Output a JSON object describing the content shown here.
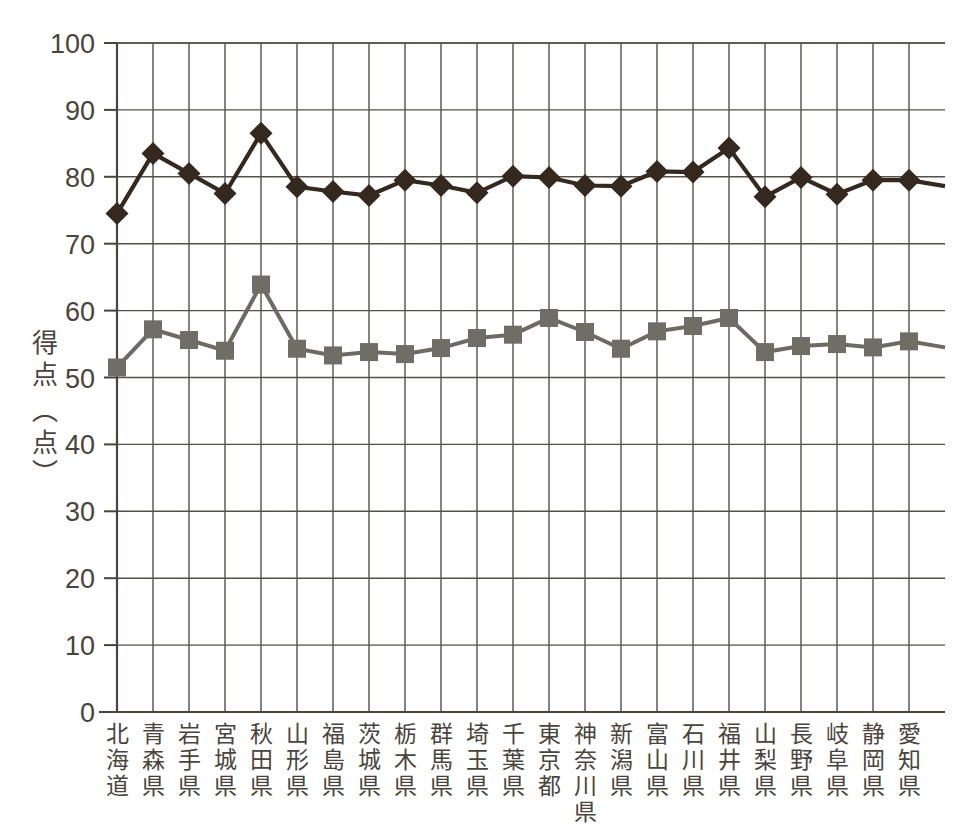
{
  "chart_data": {
    "type": "line",
    "title": "",
    "xlabel": "",
    "ylabel": "得点(点)",
    "ylabel_chars": [
      "得",
      "点",
      "(点)"
    ],
    "ylim": [
      0,
      100
    ],
    "ytick_step": 10,
    "grid": true,
    "legend": "none",
    "categories": [
      "北海道",
      "青森県",
      "岩手県",
      "宮城県",
      "秋田県",
      "山形県",
      "福島県",
      "茨城県",
      "栃木県",
      "群馬県",
      "埼玉県",
      "千葉県",
      "東京都",
      "神奈川県",
      "新潟県",
      "富山県",
      "石川県",
      "福井県",
      "山梨県",
      "長野県",
      "岐阜県",
      "静岡県",
      "愛知県"
    ],
    "yticks": [
      0,
      10,
      20,
      30,
      40,
      50,
      60,
      70,
      80,
      90,
      100
    ],
    "series": [
      {
        "name": "上位系列",
        "marker": "diamond",
        "color": "#35281f",
        "values": [
          74.5,
          83.5,
          80.5,
          77.5,
          86.5,
          78.5,
          77.8,
          77.2,
          79.5,
          78.7,
          77.6,
          80.1,
          79.9,
          78.7,
          78.6,
          80.8,
          80.7,
          84.3,
          77.0,
          79.9,
          77.4,
          79.5,
          79.5
        ],
        "trailing_value": 78.6
      },
      {
        "name": "下位系列",
        "marker": "square",
        "color": "#6e6d66",
        "values": [
          51.5,
          57.2,
          55.6,
          54.0,
          63.9,
          54.3,
          53.3,
          53.8,
          53.5,
          54.4,
          55.9,
          56.4,
          58.9,
          56.8,
          54.3,
          56.9,
          57.7,
          58.9,
          53.8,
          54.7,
          55.0,
          54.5,
          55.4
        ],
        "trailing_value": 54.5
      }
    ]
  }
}
